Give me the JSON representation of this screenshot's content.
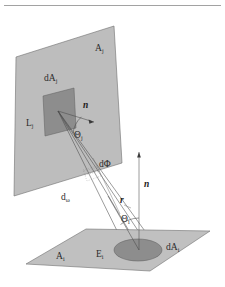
{
  "figure": {
    "caption_rule": true,
    "background": "#ffffff",
    "colors": {
      "plane_fill": "#b9b9b9",
      "plane_fill_light": "#c3c3c3",
      "patch_fill": "#8d8d8d",
      "ellipse_fill": "#8d8d8d",
      "edge": "#6f6f6f",
      "line": "#4a4a4a",
      "text": "#2b2b2b"
    },
    "labels": {
      "surface_j": {
        "base": "A",
        "sub": "j"
      },
      "patch_j": {
        "base": "dA",
        "sub": "j"
      },
      "radiance_j": {
        "base": "L",
        "sub": "j"
      },
      "normal_j": "n",
      "theta_j": {
        "base": "Θ",
        "sub": "j"
      },
      "flux": "dΦ",
      "normal_i": "n",
      "distance": "r",
      "solid_angle": {
        "base": "d",
        "sub": "ω"
      },
      "theta_i": {
        "base": "Θ",
        "sub": "i"
      },
      "surface_i": {
        "base": "A",
        "sub": "i"
      },
      "irradiance_i": {
        "base": "E",
        "sub": "i"
      },
      "patch_i": {
        "base": "dA",
        "sub": "i"
      }
    }
  }
}
